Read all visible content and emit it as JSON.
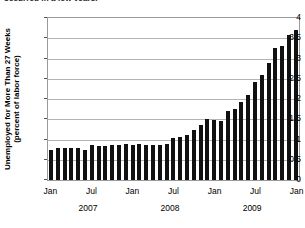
{
  "figure": {
    "clipped_headline": "occurred in a few years."
  },
  "chart_data": {
    "type": "bar",
    "title": "",
    "xlabel": "",
    "ylabel": "Unemployed for More Than 27 Weeks (percent of labor force)",
    "ylabel_line1": "Unemployed for More Than 27 Weeks",
    "ylabel_line2": "(percent of labor force)",
    "ylim": [
      0,
      4
    ],
    "yticks": [
      0,
      0.5,
      1,
      1.5,
      2,
      2.5,
      3,
      3.5,
      4
    ],
    "ytick_labels": [
      "0",
      "0.5",
      "1",
      "1.5",
      "2",
      "2.5",
      "3",
      "3.5",
      "4"
    ],
    "grid": true,
    "legend": "none",
    "xtick_labels": [
      "Jan",
      "Jul",
      "Jan",
      "Jul",
      "Jan",
      "Jul",
      "Jan"
    ],
    "year_labels": [
      "2007",
      "2008",
      "2009"
    ],
    "bar_color": "#111111",
    "categories": [
      "Jan 2007",
      "Feb 2007",
      "Mar 2007",
      "Apr 2007",
      "May 2007",
      "Jun 2007",
      "Jul 2007",
      "Aug 2007",
      "Sep 2007",
      "Oct 2007",
      "Nov 2007",
      "Dec 2007",
      "Jan 2008",
      "Feb 2008",
      "Mar 2008",
      "Apr 2008",
      "May 2008",
      "Jun 2008",
      "Jul 2008",
      "Aug 2008",
      "Sep 2008",
      "Oct 2008",
      "Nov 2008",
      "Dec 2008",
      "Jan 2009",
      "Feb 2009",
      "Mar 2009",
      "Apr 2009",
      "May 2009",
      "Jun 2009",
      "Jul 2009",
      "Aug 2009",
      "Sep 2009",
      "Oct 2009",
      "Nov 2009",
      "Dec 2009",
      "Jan 2010"
    ],
    "values": [
      0.75,
      0.8,
      0.8,
      0.8,
      0.78,
      0.75,
      0.87,
      0.84,
      0.84,
      0.87,
      0.87,
      0.9,
      0.87,
      0.9,
      0.87,
      0.86,
      0.86,
      0.9,
      1.03,
      1.06,
      1.12,
      1.23,
      1.35,
      1.5,
      1.48,
      1.46,
      1.71,
      1.76,
      1.92,
      2.1,
      2.42,
      2.59,
      2.88,
      3.25,
      3.3,
      3.57,
      3.7
    ]
  }
}
